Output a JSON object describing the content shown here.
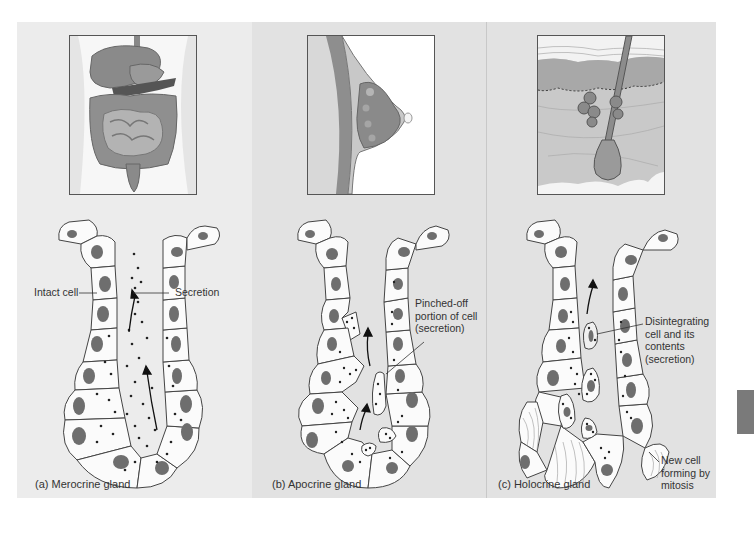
{
  "figure": {
    "panels": [
      {
        "id": "a",
        "caption": "(a)  Merocrine gland",
        "organ": "digestive-system-illustration",
        "labels": {
          "left": "Intact cell",
          "right": "Secretion"
        }
      },
      {
        "id": "b",
        "caption": "(b)  Apocrine gland",
        "organ": "breast-mammary-gland-illustration",
        "labels": {
          "line1": "Pinched-off",
          "line2": "portion of cell",
          "line3": "(secretion)"
        }
      },
      {
        "id": "c",
        "caption": "(c)  Holocrine gland",
        "organ": "skin-hair-follicle-sebaceous-gland-illustration",
        "labels": {
          "top_line1": "Disintegrating",
          "top_line2": "cell and its",
          "top_line3": "contents",
          "top_line4": "(secretion)",
          "bottom_line1": "New cell",
          "bottom_line2": "forming by",
          "bottom_line3": "mitosis"
        }
      }
    ],
    "colors": {
      "panel_light": "#ececec",
      "panel_mid": "#e2e2e2",
      "nucleus": "#6e6e6e",
      "cell_fill": "#fbfbfb",
      "outline": "#444444",
      "side_tab": "#7a7a7a"
    }
  }
}
